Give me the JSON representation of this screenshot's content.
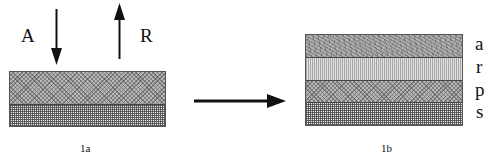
{
  "figure_1a": {
    "caption": "1a",
    "arrow_labels": {
      "incoming": "A",
      "outgoing": "R"
    },
    "layers": [
      {
        "id": "top",
        "pattern": "crosshatch"
      },
      {
        "id": "bottom",
        "pattern": "grid"
      }
    ]
  },
  "transition_arrow": {
    "direction": "right"
  },
  "figure_1b": {
    "caption": "1b",
    "layers": [
      {
        "label": "a",
        "pattern": "noise"
      },
      {
        "label": "r",
        "pattern": "vertical-lines"
      },
      {
        "label": "p",
        "pattern": "crosshatch"
      },
      {
        "label": "s",
        "pattern": "grid"
      }
    ]
  },
  "colors": {
    "ink": "#111111",
    "background": "#ffffff"
  }
}
